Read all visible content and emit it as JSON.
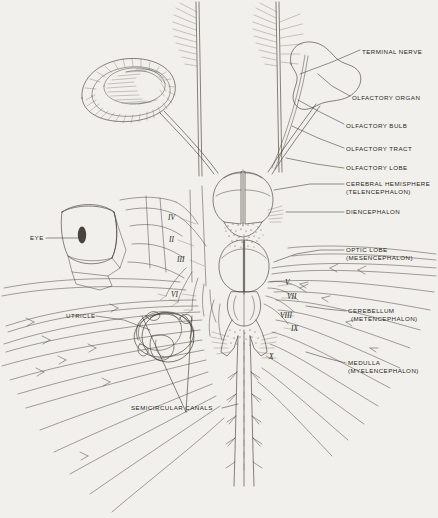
{
  "figure": {
    "background_color": "#f2f0ec",
    "ink_color": "#403a33"
  },
  "labels_right": [
    {
      "id": "terminal-nerve",
      "lines": [
        "TERMINAL NERVE"
      ],
      "x": 362,
      "y": 48
    },
    {
      "id": "olfactory-organ",
      "lines": [
        "OLFACTORY ORGAN"
      ],
      "x": 352,
      "y": 98
    },
    {
      "id": "olfactory-bulb",
      "lines": [
        "OLFACTORY BULB"
      ],
      "x": 346,
      "y": 126
    },
    {
      "id": "olfactory-tract",
      "lines": [
        "OLFACTORY TRACT"
      ],
      "x": 346,
      "y": 150
    },
    {
      "id": "olfactory-lobe",
      "lines": [
        "OLFACTORY LOBE"
      ],
      "x": 346,
      "y": 170
    },
    {
      "id": "cerebral-hemisphere",
      "lines": [
        "CEREBRAL HEMISPHERE",
        "(TELENCEPHALON)"
      ],
      "x": 346,
      "y": 185
    },
    {
      "id": "diencephalon",
      "lines": [
        "DIENCEPHALON"
      ],
      "x": 346,
      "y": 213
    },
    {
      "id": "optic-lobe",
      "lines": [
        "OPTIC LOBE",
        "(MESENCEPHALON)"
      ],
      "x": 346,
      "y": 251
    },
    {
      "id": "cerebellum",
      "lines": [
        "CEREBELLUM",
        "(METENCEPHALON)"
      ],
      "x": 348,
      "y": 312
    },
    {
      "id": "medulla",
      "lines": [
        "MEDULLA",
        "(MYELENCEPHALON)"
      ],
      "x": 348,
      "y": 364
    }
  ],
  "labels_left": [
    {
      "id": "eye",
      "lines": [
        "EYE"
      ],
      "x": 30,
      "y": 238
    },
    {
      "id": "utricle",
      "lines": [
        "UTRICLE"
      ],
      "x": 68,
      "y": 315
    },
    {
      "id": "semicircular-canals",
      "lines": [
        "SEMICIRCULAR CANALS"
      ],
      "x": 133,
      "y": 405
    }
  ],
  "cranial_nerves": [
    {
      "id": "nerve-iv",
      "numeral": "IV",
      "x": 168,
      "y": 216
    },
    {
      "id": "nerve-ii",
      "numeral": "II",
      "x": 169,
      "y": 238
    },
    {
      "id": "nerve-iii",
      "numeral": "III",
      "x": 178,
      "y": 258
    },
    {
      "id": "nerve-vi",
      "numeral": "VI",
      "x": 172,
      "y": 293
    },
    {
      "id": "nerve-v",
      "numeral": "V",
      "x": 285,
      "y": 281
    },
    {
      "id": "nerve-vii",
      "numeral": "VII",
      "x": 287,
      "y": 295
    },
    {
      "id": "nerve-viii",
      "numeral": "VIII",
      "x": 281,
      "y": 314
    },
    {
      "id": "nerve-ix",
      "numeral": "IX",
      "x": 291,
      "y": 327
    },
    {
      "id": "nerve-x",
      "numeral": "X",
      "x": 270,
      "y": 355
    }
  ]
}
